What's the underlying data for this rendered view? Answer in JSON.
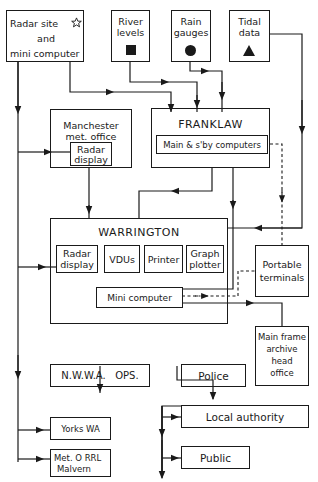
{
  "diagram": {
    "nodes": {
      "radar_site": {
        "line1": "Radar site",
        "line2": "and",
        "line3": "mini computer",
        "symbol": "star-icon"
      },
      "river_levels": {
        "line1": "River",
        "line2": "levels",
        "symbol": "square-icon"
      },
      "rain_gauges": {
        "line1": "Rain",
        "line2": "gauges",
        "symbol": "circle-icon"
      },
      "tidal_data": {
        "line1": "Tidal",
        "line2": "data",
        "symbol": "triangle-icon"
      },
      "manchester": {
        "line1": "Manchester",
        "line2": "met. office",
        "inner_line1": "Radar",
        "inner_line2": "display"
      },
      "franklaw": {
        "title": "FRANKLAW",
        "inner": "Main & s'by computers"
      },
      "warrington": {
        "title": "WARRINGTON",
        "radar_line1": "Radar",
        "radar_line2": "display",
        "vdus": "VDUs",
        "printer": "Printer",
        "graph_line1": "Graph",
        "graph_line2": "plotter",
        "mini": "Mini computer"
      },
      "portable_terminals": {
        "line1": "Portable",
        "line2": "terminals"
      },
      "main_frame": {
        "line1": "Main frame",
        "line2": "archive",
        "line3": "head",
        "line4": "office"
      },
      "nwwa_ops": {
        "label": "N.W.W.A.   OPS."
      },
      "police": {
        "label": "Police"
      },
      "local_authority": {
        "label": "Local authority"
      },
      "public": {
        "label": "Public"
      },
      "yorks_wa": {
        "label": "Yorks WA"
      },
      "met_o": {
        "line1": "Met. O RRL",
        "line2": "Malvern"
      }
    },
    "colors": {
      "line": "#1a1a1a",
      "background": "#ffffff"
    }
  }
}
